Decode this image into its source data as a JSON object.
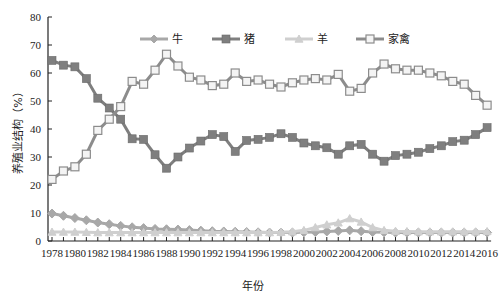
{
  "chart_data": {
    "type": "line",
    "title": "",
    "xlabel": "年份",
    "ylabel": "养殖业结构（%）",
    "ylim": [
      0,
      80
    ],
    "yticks": [
      0,
      10,
      20,
      30,
      40,
      50,
      60,
      70,
      80
    ],
    "xtick_labels": [
      "1978",
      "1980",
      "1982",
      "1984",
      "1986",
      "1988",
      "1990",
      "1992",
      "1994",
      "1996",
      "1998",
      "2000",
      "2002",
      "2004",
      "2006",
      "2008",
      "2010",
      "2012",
      "2014",
      "2016"
    ],
    "x": [
      1978,
      1979,
      1980,
      1981,
      1982,
      1983,
      1984,
      1985,
      1986,
      1987,
      1988,
      1989,
      1990,
      1991,
      1992,
      1993,
      1994,
      1995,
      1996,
      1997,
      1998,
      1999,
      2000,
      2001,
      2002,
      2003,
      2004,
      2005,
      2006,
      2007,
      2008,
      2009,
      2010,
      2011,
      2012,
      2013,
      2014,
      2015,
      2016
    ],
    "grid": false,
    "legend_position": "top-inside",
    "series": [
      {
        "name": "牛",
        "marker": "diamond",
        "color": "#a8a8a8",
        "values": [
          9.8,
          9.0,
          8.2,
          7.4,
          6.6,
          6.0,
          5.4,
          4.9,
          4.6,
          4.3,
          4.2,
          4.1,
          3.9,
          3.7,
          3.5,
          3.4,
          3.3,
          3.2,
          3.1,
          3.0,
          3.0,
          3.0,
          3.1,
          3.2,
          3.4,
          3.6,
          3.8,
          3.5,
          3.2,
          3.1,
          3.0,
          3.0,
          3.0,
          3.0,
          3.0,
          3.0,
          3.0,
          3.0,
          3.0
        ]
      },
      {
        "name": "猪",
        "marker": "square-filled",
        "color": "#7f7f7f",
        "values": [
          64.5,
          62.8,
          62.2,
          58.0,
          51.0,
          47.5,
          43.5,
          36.5,
          36.3,
          30.8,
          26.0,
          30.0,
          33.2,
          35.7,
          38.0,
          37.3,
          32.0,
          35.9,
          36.3,
          37.0,
          38.3,
          37.0,
          35.0,
          34.0,
          33.3,
          31.0,
          34.0,
          34.5,
          31.0,
          28.5,
          30.5,
          31.0,
          31.7,
          33.0,
          34.0,
          35.5,
          36.0,
          38.0,
          40.5
        ]
      },
      {
        "name": "羊",
        "marker": "triangle",
        "color": "#cfcfcf",
        "values": [
          3.2,
          3.2,
          3.2,
          3.1,
          3.0,
          3.0,
          3.0,
          3.0,
          3.0,
          3.0,
          3.0,
          3.0,
          3.0,
          3.0,
          3.0,
          3.0,
          3.0,
          3.0,
          3.0,
          3.0,
          3.1,
          3.3,
          3.8,
          4.8,
          5.8,
          6.5,
          8.0,
          6.8,
          4.8,
          3.8,
          3.5,
          3.4,
          3.3,
          3.3,
          3.3,
          3.3,
          3.3,
          3.3,
          3.4
        ]
      },
      {
        "name": "家禽",
        "marker": "square-open",
        "color": "#8c8c8c",
        "values": [
          22.0,
          25.0,
          26.5,
          31.0,
          39.5,
          43.5,
          48.0,
          57.0,
          56.0,
          61.0,
          66.7,
          62.5,
          58.5,
          57.5,
          55.5,
          56.0,
          60.0,
          57.0,
          57.5,
          56.0,
          55.0,
          56.5,
          57.5,
          58.0,
          57.5,
          59.5,
          53.5,
          54.5,
          60.0,
          63.2,
          61.5,
          61.0,
          61.0,
          60.0,
          59.0,
          57.0,
          56.0,
          52.0,
          48.5
        ]
      }
    ]
  }
}
